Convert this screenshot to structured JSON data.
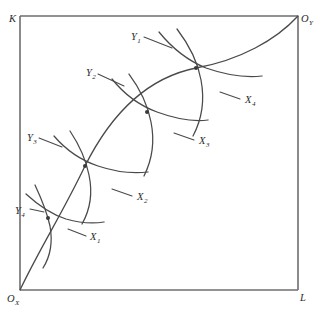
{
  "figure": {
    "type": "edgeworth-box",
    "title": "",
    "background_color": "#ffffff",
    "line_color": "#4a4a4a",
    "axis_color": "#6e6e6e"
  },
  "box": {
    "left": 20,
    "top": 16,
    "right": 298,
    "bottom": 290,
    "width": 278,
    "height": 274
  },
  "axis_labels": {
    "vertical": {
      "main": "K",
      "sub": "",
      "x": 9,
      "y": 22
    },
    "horizontal": {
      "main": "L",
      "sub": "",
      "x": 300,
      "y": 301
    },
    "origin_x": {
      "main": "O",
      "sub": "X",
      "x": 7,
      "y": 302
    },
    "origin_y": {
      "main": "O",
      "sub": "Y",
      "x": 301,
      "y": 22
    }
  },
  "contract_curve": {
    "name": "contract-curve",
    "path": "M 20 290 C 40 248 62 214 85 166 C 110 116 146 78 196 68 C 240 60 276 40 298 16",
    "from": "O_X",
    "to": "O_Y"
  },
  "tangency_points": [
    {
      "name": "tangency-1",
      "x": 48,
      "y": 218,
      "pair": "Y4-X1"
    },
    {
      "name": "tangency-2",
      "x": 85,
      "y": 166,
      "pair": "Y3-X2"
    },
    {
      "name": "tangency-3",
      "x": 147,
      "y": 112,
      "pair": "Y2-X3"
    },
    {
      "name": "tangency-4",
      "x": 196,
      "y": 68,
      "pair": "Y1-X4"
    }
  ],
  "curves_x": [
    {
      "id": "X1",
      "label_main": "X",
      "label_sub": "1",
      "label_x": 90,
      "label_y": 240,
      "path": "M 35 185 C 42 200 47 212 50 226 C 53 243 50 257 43 268",
      "leader": "M 86 236 L 68 229"
    },
    {
      "id": "X2",
      "label_main": "X",
      "label_sub": "2",
      "label_x": 137,
      "label_y": 200,
      "path": "M 70 131 C 80 146 86 160 89 175 C 93 194 90 210 82 224",
      "leader": "M 132 196 L 112 189"
    },
    {
      "id": "X3",
      "label_main": "X",
      "label_sub": "3",
      "label_x": 199,
      "label_y": 144,
      "path": "M 129 74 C 141 90 148 106 151 122 C 155 142 152 160 144 176",
      "leader": "M 194 140 L 174 133"
    },
    {
      "id": "X4",
      "label_main": "X",
      "label_sub": "4",
      "label_x": 245,
      "label_y": 103,
      "path": "M 177 29 C 190 46 198 63 201 80 C 205 101 202 119 193 136",
      "leader": "M 240 99 L 220 92"
    }
  ],
  "curves_y": [
    {
      "id": "Y4",
      "label_main": "Y",
      "label_sub": "4",
      "label_x": 15,
      "label_y": 214,
      "path": "M 26 194 C 38 205 50 214 66 219 C 80 223 92 224 104 222",
      "leader": "M 30 209 L 44 212"
    },
    {
      "id": "Y3",
      "label_main": "Y",
      "label_sub": "3",
      "label_x": 27,
      "label_y": 141,
      "path": "M 54 136 C 66 150 80 160 98 166 C 116 172 132 174 148 172",
      "leader": "M 39 138 L 62 147"
    },
    {
      "id": "Y2",
      "label_main": "Y",
      "label_sub": "2",
      "label_x": 86,
      "label_y": 76,
      "path": "M 112 79 C 124 94 138 105 157 112 C 176 119 192 122 208 120",
      "leader": "M 98 74 L 124 86"
    },
    {
      "id": "Y1",
      "label_main": "Y",
      "label_sub": "1",
      "label_x": 131,
      "label_y": 40,
      "path": "M 159 32 C 172 48 186 60 206 68 C 226 75 244 78 262 76",
      "leader": "M 144 37 L 172 48"
    }
  ]
}
